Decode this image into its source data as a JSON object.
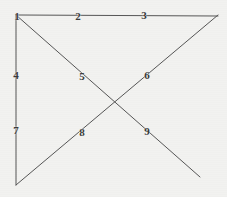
{
  "figure": {
    "background_color": "#f2f2f0",
    "stroke_color": "#555555",
    "label_color": "#3a3a3a",
    "width": 227,
    "height": 197,
    "vertices": {
      "top_left": [
        16,
        15
      ],
      "top_right": [
        218,
        15
      ],
      "bottom_left": [
        16,
        185
      ],
      "bottom_right_open": [
        200,
        177
      ],
      "crossing": [
        114,
        103
      ]
    },
    "strokes": [
      {
        "name": "top-horizontal-line",
        "from": [
          16,
          15
        ],
        "to": [
          218,
          16
        ]
      },
      {
        "name": "left-vertical-line",
        "from": [
          16,
          15
        ],
        "to": [
          16,
          185
        ]
      },
      {
        "name": "descending-diagonal-line",
        "from": [
          16,
          15
        ],
        "to": [
          200,
          177
        ]
      },
      {
        "name": "ascending-diagonal-line",
        "from": [
          16,
          185
        ],
        "to": [
          218,
          15
        ]
      }
    ],
    "labels": [
      {
        "id": "1",
        "text": "1",
        "x": 17,
        "y": 17,
        "on": "top-left-vertex"
      },
      {
        "id": "2",
        "text": "2",
        "x": 78,
        "y": 17,
        "on": "top-horizontal-line"
      },
      {
        "id": "3",
        "text": "3",
        "x": 144,
        "y": 16,
        "on": "top-horizontal-line"
      },
      {
        "id": "4",
        "text": "4",
        "x": 16,
        "y": 76,
        "on": "left-vertical-line"
      },
      {
        "id": "5",
        "text": "5",
        "x": 82,
        "y": 77,
        "on": "descending-diagonal-line"
      },
      {
        "id": "6",
        "text": "6",
        "x": 147,
        "y": 76,
        "on": "ascending-diagonal-line"
      },
      {
        "id": "7",
        "text": "7",
        "x": 16,
        "y": 131,
        "on": "left-vertical-line"
      },
      {
        "id": "8",
        "text": "8",
        "x": 82,
        "y": 133,
        "on": "ascending-diagonal-line"
      },
      {
        "id": "9",
        "text": "9",
        "x": 147,
        "y": 132,
        "on": "descending-diagonal-line"
      }
    ]
  }
}
